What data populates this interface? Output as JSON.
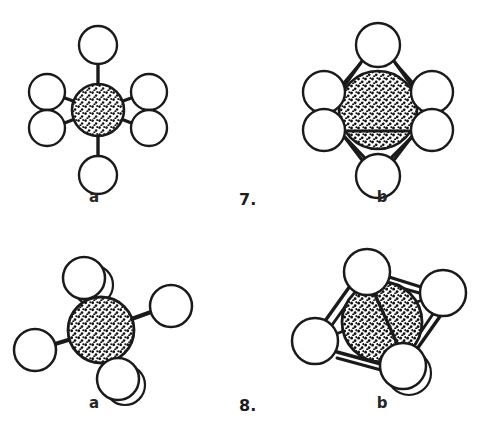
{
  "page": {
    "width": 483,
    "height": 436,
    "background": "#ffffff",
    "kind": "chemistry-coordination-geometry-figure"
  },
  "style": {
    "line_color": "#1a1a1a",
    "circle_fill": "#ffffff",
    "circle_stroke": "#1a1a1a",
    "sphere_fill": "#ffffff",
    "sphere_stroke": "#1a1a1a",
    "stipple_color": "#111111",
    "text_color": "#262626"
  },
  "figures": [
    {
      "id": "figure-7",
      "number_label": "7.",
      "geometry": "octahedral",
      "panels": [
        {
          "id": "panel-7a",
          "caption": "a",
          "representation": "ball-and-stick",
          "center_atom": {
            "cx": 98,
            "cy": 110,
            "r": 26,
            "texture": "stippled"
          },
          "ligands": [
            {
              "name": "ligand-top",
              "cx": 98,
              "cy": 45,
              "r": 19
            },
            {
              "name": "ligand-upper-left",
              "cx": 47,
              "cy": 92,
              "r": 18
            },
            {
              "name": "ligand-upper-right",
              "cx": 149,
              "cy": 92,
              "r": 18
            },
            {
              "name": "ligand-lower-left",
              "cx": 47,
              "cy": 128,
              "r": 18
            },
            {
              "name": "ligand-lower-right",
              "cx": 149,
              "cy": 128,
              "r": 18
            },
            {
              "name": "ligand-bottom",
              "cx": 98,
              "cy": 175,
              "r": 19
            }
          ]
        },
        {
          "id": "panel-7b",
          "caption": "b",
          "representation": "polyhedron",
          "center_atom": {
            "cx": 378,
            "cy": 110,
            "r": 39,
            "texture": "stippled"
          },
          "ligands": [
            {
              "name": "vertex-top",
              "cx": 378,
              "cy": 45,
              "r": 22
            },
            {
              "name": "vertex-upper-left",
              "cx": 324,
              "cy": 92,
              "r": 21
            },
            {
              "name": "vertex-upper-right",
              "cx": 432,
              "cy": 92,
              "r": 21
            },
            {
              "name": "vertex-lower-left",
              "cx": 324,
              "cy": 130,
              "r": 21
            },
            {
              "name": "vertex-lower-right",
              "cx": 432,
              "cy": 130,
              "r": 21
            },
            {
              "name": "vertex-bottom",
              "cx": 378,
              "cy": 176,
              "r": 22
            }
          ]
        }
      ]
    },
    {
      "id": "figure-8",
      "number_label": "8.",
      "geometry": "tetrahedral",
      "panels": [
        {
          "id": "panel-8a",
          "caption": "a",
          "representation": "ball-and-stick",
          "center_atom": {
            "cx": 101,
            "cy": 330,
            "r": 33,
            "texture": "stippled"
          },
          "ligands": [
            {
              "name": "ligand-upper",
              "cx": 84,
              "cy": 278,
              "r": 21
            },
            {
              "name": "ligand-right",
              "cx": 171,
              "cy": 306,
              "r": 21
            },
            {
              "name": "ligand-left",
              "cx": 35,
              "cy": 350,
              "r": 21
            },
            {
              "name": "ligand-bottom",
              "cx": 118,
              "cy": 379,
              "r": 21
            }
          ]
        },
        {
          "id": "panel-8b",
          "caption": "b",
          "representation": "polyhedron",
          "center_atom": {
            "cx": 382,
            "cy": 322,
            "r": 40,
            "texture": "stippled"
          },
          "ligands": [
            {
              "name": "vertex-top",
              "cx": 367,
              "cy": 272,
              "r": 23
            },
            {
              "name": "vertex-right",
              "cx": 443,
              "cy": 293,
              "r": 23
            },
            {
              "name": "vertex-left",
              "cx": 315,
              "cy": 341,
              "r": 23
            },
            {
              "name": "vertex-bottom",
              "cx": 403,
              "cy": 366,
              "r": 23
            }
          ]
        }
      ]
    }
  ],
  "labels": {
    "caption_7a": "a",
    "caption_7b": "b",
    "caption_8a": "a",
    "caption_8b": "b",
    "number_7": "7.",
    "number_8": "8."
  }
}
